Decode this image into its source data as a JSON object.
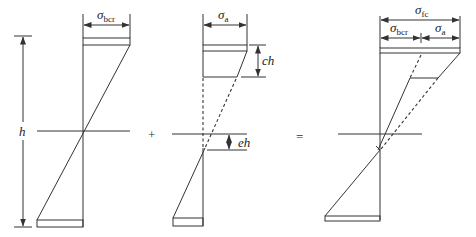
{
  "figure": {
    "left_panel": {
      "height_label": "h",
      "top_width_label": {
        "main": "σ",
        "sub": "bcr"
      }
    },
    "operator_plus": "+",
    "middle_panel": {
      "top_width_label": {
        "main": "σ",
        "sub": "a"
      },
      "top_depth_label": "ch",
      "offset_label": "eh"
    },
    "operator_equals": "=",
    "right_panel": {
      "total_width_label": {
        "main": "σ",
        "sub": "fc"
      },
      "left_part_label": {
        "main": "σ",
        "sub": "bcr"
      },
      "right_part_label": {
        "main": "σ",
        "sub": "a"
      }
    }
  }
}
